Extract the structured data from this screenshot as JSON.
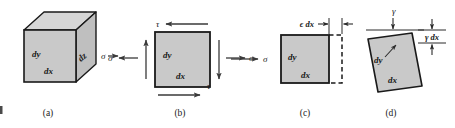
{
  "figure": {
    "panels": [
      {
        "id": "a",
        "caption": "(a)",
        "kind": "3d-cube-element",
        "labels": {
          "dy": "dy",
          "dx": "dx",
          "dz": "dz"
        },
        "stress_labels": [
          {
            "symbol": "σ",
            "position": "right"
          }
        ]
      },
      {
        "id": "b",
        "caption": "(b)",
        "kind": "2d-element-shear-and-normal-stress",
        "labels": {
          "dy": "dy",
          "dx": "dx"
        },
        "stress_labels": [
          {
            "symbol": "τ",
            "position": "top-left"
          },
          {
            "symbol": "τ",
            "position": "bottom-right"
          },
          {
            "symbol": "σ",
            "position": "left"
          },
          {
            "symbol": "σ",
            "position": "right"
          }
        ]
      },
      {
        "id": "c",
        "caption": "(c)",
        "kind": "2d-element-normal-strain",
        "labels": {
          "dy": "dy",
          "dx": "dx"
        },
        "stress_labels": [
          {
            "symbol": "σ",
            "position": "left"
          }
        ],
        "dimension_labels": [
          {
            "text": "ϵ dx",
            "orientation": "horizontal",
            "position": "top-right"
          }
        ]
      },
      {
        "id": "d",
        "caption": "(d)",
        "kind": "2d-element-shear-strain",
        "labels": {
          "dy": "dy",
          "dx": "dx"
        },
        "strain_labels": [
          {
            "text": "γ",
            "position": "top-center"
          }
        ],
        "dimension_labels": [
          {
            "text": "γ dx",
            "orientation": "vertical",
            "position": "top-right"
          }
        ]
      }
    ],
    "colors": {
      "face_fill": "#c9c9c9",
      "top_fill": "#d5d5d5",
      "side_fill": "#c0c0c0",
      "outline": "#1a1a1a",
      "arrow": "#3a3a3a",
      "background": "#ffffff"
    }
  }
}
